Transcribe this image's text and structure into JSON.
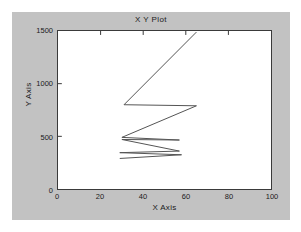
{
  "figure": {
    "background_color": "#c2c2c2",
    "plot_background_color": "#ffffff",
    "axis_color": "#3a3a3a",
    "line_color": "#555555"
  },
  "chart_data": {
    "type": "line",
    "title": "X Y Plot",
    "xlabel": "X Axis",
    "ylabel": "Y Axis",
    "xlim": [
      0,
      100
    ],
    "ylim": [
      0,
      1500
    ],
    "xticks": [
      0,
      20,
      40,
      60,
      80,
      100
    ],
    "yticks": [
      0,
      500,
      1000,
      1500
    ],
    "xtick_labels": [
      "0",
      "20",
      "40",
      "60",
      "80",
      "100"
    ],
    "ytick_labels": [
      "0",
      "500",
      "1000",
      "1500"
    ],
    "grid": false,
    "legend": null,
    "series": [
      {
        "name": "series-1",
        "color": "#555555",
        "x": [
          29,
          58,
          29,
          57,
          30,
          57,
          30,
          65,
          31,
          65
        ],
        "y": [
          1210,
          1175,
          1155,
          1140,
          1030,
          1035,
          1010,
          710,
          700,
          10
        ]
      }
    ]
  }
}
